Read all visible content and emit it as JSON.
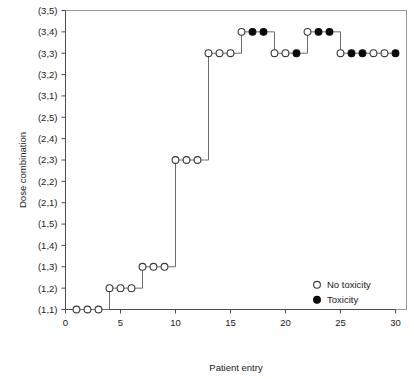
{
  "chart_data": {
    "type": "line",
    "title": "",
    "xlabel": "Patient entry",
    "ylabel": "Dose combination",
    "xlim": [
      0,
      31
    ],
    "ylim": [
      1,
      15
    ],
    "xticks": [
      0,
      5,
      10,
      15,
      20,
      25,
      30
    ],
    "yticks": [
      "(1,1)",
      "(1,2)",
      "(1,3)",
      "(1,4)",
      "(1,5)",
      "(2,1)",
      "(2,2)",
      "(2,3)",
      "(2,4)",
      "(2,5)",
      "(3,1)",
      "(3,2)",
      "(3,3)",
      "(3,4)",
      "(3,5)"
    ],
    "grid": false,
    "legend_position": "bottom-right",
    "legend": [
      {
        "label": "No toxicity",
        "marker": "open-circle"
      },
      {
        "label": "Toxicity",
        "marker": "filled-circle"
      }
    ],
    "x": [
      1,
      2,
      3,
      4,
      5,
      6,
      7,
      8,
      9,
      10,
      11,
      12,
      13,
      14,
      15,
      16,
      17,
      18,
      19,
      20,
      21,
      22,
      23,
      24,
      25,
      26,
      27,
      28,
      29,
      30
    ],
    "dose_labels": [
      "(1,1)",
      "(1,1)",
      "(1,1)",
      "(1,2)",
      "(1,2)",
      "(1,2)",
      "(1,3)",
      "(1,3)",
      "(1,3)",
      "(2,3)",
      "(2,3)",
      "(2,3)",
      "(3,3)",
      "(3,3)",
      "(3,3)",
      "(3,4)",
      "(3,4)",
      "(3,4)",
      "(3,3)",
      "(3,3)",
      "(3,3)",
      "(3,4)",
      "(3,4)",
      "(3,4)",
      "(3,3)",
      "(3,3)",
      "(3,3)",
      "(3,3)",
      "(3,3)",
      "(3,3)"
    ],
    "dose_index": [
      1,
      1,
      1,
      2,
      2,
      2,
      3,
      3,
      3,
      8,
      8,
      8,
      13,
      13,
      13,
      14,
      14,
      14,
      13,
      13,
      13,
      14,
      14,
      14,
      13,
      13,
      13,
      13,
      13,
      13
    ],
    "toxicity": [
      false,
      false,
      false,
      false,
      false,
      false,
      false,
      false,
      false,
      false,
      false,
      false,
      false,
      false,
      false,
      false,
      true,
      true,
      false,
      false,
      true,
      false,
      true,
      true,
      false,
      true,
      true,
      false,
      false,
      true
    ]
  },
  "axes": {
    "x_title": "Patient entry",
    "y_title": "Dose combination"
  },
  "colors": {
    "marker_fill": "#0a0a0a",
    "marker_open": "#ffffff",
    "line": "#6b6b6b",
    "axis": "#4d4d4d",
    "background": "#ffffff"
  }
}
